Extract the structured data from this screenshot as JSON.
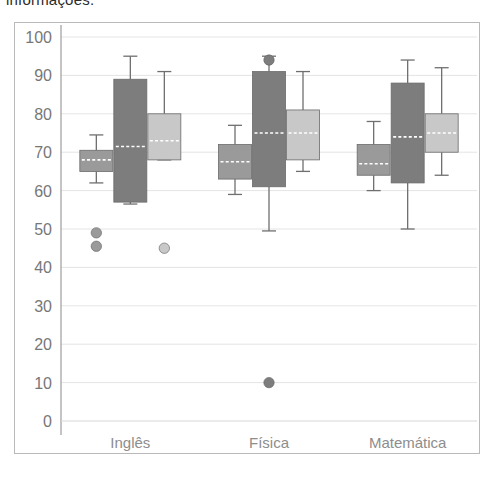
{
  "caption": {
    "text": "informações."
  },
  "chart_data": {
    "type": "box",
    "title": "",
    "xlabel": "",
    "ylabel": "",
    "ylim": [
      0,
      100
    ],
    "yticks": [
      0,
      10,
      20,
      30,
      40,
      50,
      60,
      70,
      80,
      90,
      100
    ],
    "ytick_labels": [
      "0",
      "10",
      "20",
      "30",
      "40",
      "50",
      "60",
      "70",
      "80",
      "90",
      "100"
    ],
    "grid": true,
    "legend": "none",
    "categories": [
      "Inglês",
      "Física",
      "Matemática"
    ],
    "series": [
      {
        "name": "series-1",
        "color": "#9a9a9a",
        "boxes": [
          {
            "category": "Inglês",
            "whisker_low": 62.0,
            "q1": 65.0,
            "median": 68.0,
            "q3": 70.5,
            "whisker_high": 74.5,
            "outliers": [
              49.0,
              45.5
            ]
          },
          {
            "category": "Física",
            "whisker_low": 59.0,
            "q1": 63.0,
            "median": 67.5,
            "q3": 72.0,
            "whisker_high": 77.0,
            "outliers": []
          },
          {
            "category": "Matemática",
            "whisker_low": 60.0,
            "q1": 64.0,
            "median": 67.0,
            "q3": 72.0,
            "whisker_high": 78.0,
            "outliers": []
          }
        ]
      },
      {
        "name": "series-2",
        "color": "#7d7d7d",
        "boxes": [
          {
            "category": "Inglês",
            "whisker_low": 56.5,
            "q1": 57.0,
            "median": 71.5,
            "q3": 89.0,
            "whisker_high": 95.0,
            "outliers": []
          },
          {
            "category": "Física",
            "whisker_low": 49.5,
            "q1": 61.0,
            "median": 75.0,
            "q3": 91.0,
            "whisker_high": 95.0,
            "outliers": [
              94.0,
              10.0
            ]
          },
          {
            "category": "Matemática",
            "whisker_low": 50.0,
            "q1": 62.0,
            "median": 74.0,
            "q3": 88.0,
            "whisker_high": 94.0,
            "outliers": []
          }
        ]
      },
      {
        "name": "series-3",
        "color": "#c8c8c8",
        "boxes": [
          {
            "category": "Inglês",
            "whisker_low": 68.0,
            "q1": 68.0,
            "median": 73.0,
            "q3": 80.0,
            "whisker_high": 91.0,
            "outliers": [
              45.0
            ]
          },
          {
            "category": "Física",
            "whisker_low": 65.0,
            "q1": 68.0,
            "median": 75.0,
            "q3": 81.0,
            "whisker_high": 91.0,
            "outliers": []
          },
          {
            "category": "Matemática",
            "whisker_low": 64.0,
            "q1": 70.0,
            "median": 75.0,
            "q3": 80.0,
            "whisker_high": 92.0,
            "outliers": []
          }
        ]
      }
    ]
  }
}
